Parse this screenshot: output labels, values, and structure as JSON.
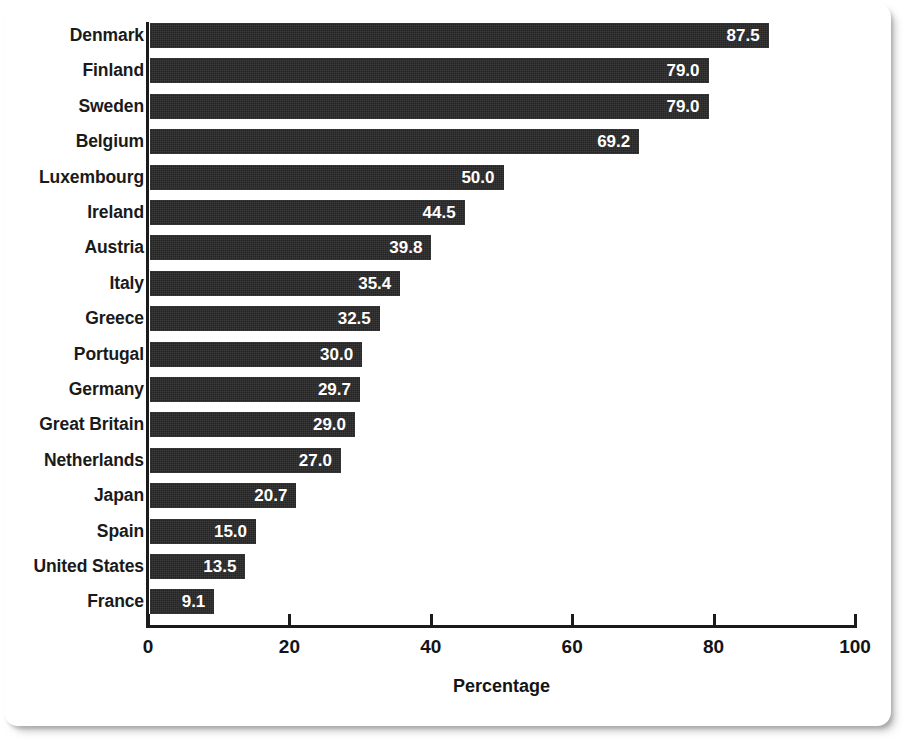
{
  "chart_data": {
    "type": "bar",
    "orientation": "horizontal",
    "title": "",
    "subtitle": "",
    "xlabel": "Percentage",
    "ylabel": "",
    "xlim": [
      0,
      100
    ],
    "xticks": [
      0,
      20,
      40,
      60,
      80,
      100
    ],
    "xtick_labels": [
      "0",
      "20",
      "40",
      "60",
      "80",
      "100"
    ],
    "grid": false,
    "legend": null,
    "value_label_format": "one-decimal",
    "bar_color": "#242424",
    "value_label_color": "#ffffff",
    "axis_color": "#1b1b1b",
    "background": "#ffffff",
    "categories": [
      "Denmark",
      "Finland",
      "Sweden",
      "Belgium",
      "Luxembourg",
      "Ireland",
      "Austria",
      "Italy",
      "Greece",
      "Portugal",
      "Germany",
      "Great Britain",
      "Netherlands",
      "Japan",
      "Spain",
      "United States",
      "France"
    ],
    "values": [
      87.5,
      79.0,
      79.0,
      69.2,
      50.0,
      44.5,
      39.8,
      35.4,
      32.5,
      30.0,
      29.7,
      29.0,
      27.0,
      20.7,
      15.0,
      13.5,
      9.1
    ],
    "value_labels": [
      "87.5",
      "79.0",
      "79.0",
      "69.2",
      "50.0",
      "44.5",
      "39.8",
      "35.4",
      "32.5",
      "30.0",
      "29.7",
      "29.0",
      "27.0",
      "20.7",
      "15.0",
      "13.5",
      "9.1"
    ]
  }
}
